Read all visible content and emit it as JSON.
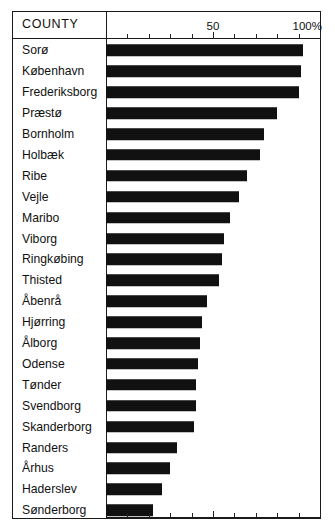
{
  "header": {
    "category_column_label": "COUNTY"
  },
  "axis": {
    "tick_labels": [
      "50",
      "100%"
    ],
    "tick_values": [
      50,
      100
    ],
    "minor_tick_step": 10,
    "min": 0,
    "max": 100
  },
  "colors": {
    "bar": "#111111",
    "frame": "#1a1a1a",
    "background": "#ffffff",
    "text": "#111111"
  },
  "chart_data": {
    "type": "bar",
    "orientation": "horizontal",
    "title": "",
    "subtitle": "",
    "xlabel": "",
    "ylabel": "COUNTY",
    "xlim": [
      0,
      100
    ],
    "grid": false,
    "legend": false,
    "unit": "%",
    "categories": [
      "Sorø",
      "København",
      "Frederiksborg",
      "Præstø",
      "Bornholm",
      "Holbæk",
      "Ribe",
      "Vejle",
      "Maribo",
      "Viborg",
      "Ringkøbing",
      "Thisted",
      "Åbenrå",
      "Hjørring",
      "Ålborg",
      "Odense",
      "Tønder",
      "Svendborg",
      "Skanderborg",
      "Randers",
      "Århus",
      "Haderslev",
      "Sønderborg"
    ],
    "values": [
      92,
      91,
      90,
      80,
      74,
      72,
      66,
      62,
      58,
      55,
      54,
      53,
      47,
      45,
      44,
      43,
      42,
      42,
      41,
      33,
      30,
      26,
      22
    ]
  }
}
